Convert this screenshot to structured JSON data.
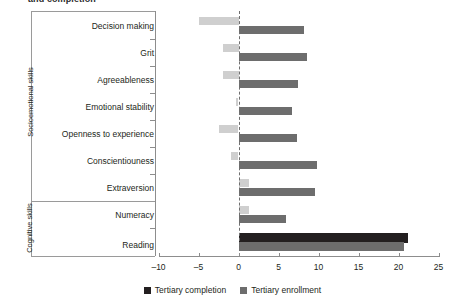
{
  "figure": {
    "title": "and completion",
    "legend": [
      {
        "label": "Tertiary completion",
        "color": "#231f20"
      },
      {
        "label": "Tertiary enrollment",
        "color": "#6d6d6d"
      }
    ]
  },
  "groups": [
    {
      "label": "Socioemotional skills",
      "rows": 7
    },
    {
      "label": "Cognitive skills",
      "rows": 2
    }
  ],
  "axis": {
    "ticks": [
      "-10",
      "-5",
      "0",
      "5",
      "10",
      "15",
      "20",
      "25"
    ],
    "min": -10,
    "max": 25
  },
  "chart_data": {
    "type": "bar",
    "orientation": "horizontal",
    "title": "and completion",
    "xlabel": "",
    "ylabel": "",
    "xlim": [
      -10,
      25
    ],
    "grid": false,
    "legend_position": "bottom",
    "zero_reference_line": true,
    "categories": [
      "Decision making",
      "Grit",
      "Agreeableness",
      "Emotional stability",
      "Openness to experience",
      "Conscientiouness",
      "Extraversion",
      "Numeracy",
      "Reading"
    ],
    "category_groups": [
      "Socioemotional skills",
      "Socioemotional skills",
      "Socioemotional skills",
      "Socioemotional skills",
      "Socioemotional skills",
      "Socioemotional skills",
      "Socioemotional skills",
      "Cognitive skills",
      "Cognitive skills"
    ],
    "series": [
      {
        "name": "Tertiary completion",
        "color": "#231f20",
        "values": [
          -5.0,
          -2.0,
          -2.0,
          -0.3,
          -2.4,
          -0.9,
          1.3,
          1.3,
          21.2
        ]
      },
      {
        "name": "Tertiary enrollment",
        "color": "#6d6d6d",
        "values": [
          8.2,
          8.6,
          7.4,
          6.7,
          7.3,
          9.8,
          9.5,
          5.9,
          20.7
        ]
      }
    ]
  }
}
